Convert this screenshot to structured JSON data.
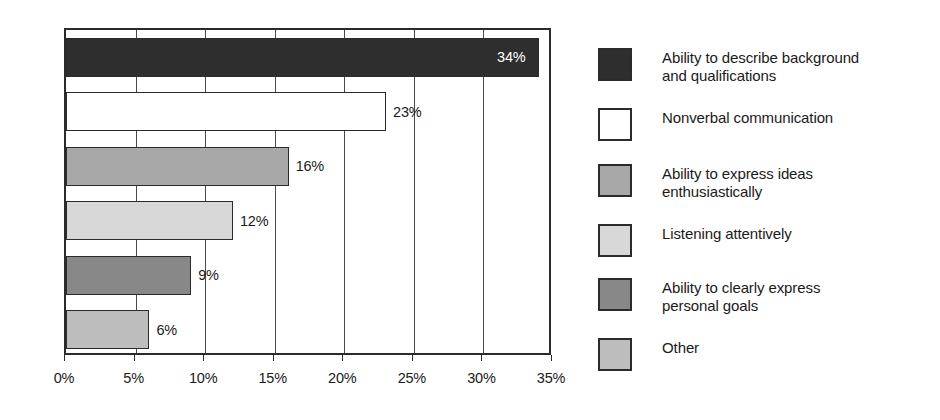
{
  "chart_data": {
    "type": "bar",
    "orientation": "horizontal",
    "title": "",
    "xlabel": "",
    "ylabel": "",
    "xlim": [
      0,
      35
    ],
    "grid": true,
    "legend_position": "right",
    "categories": [
      "Ability to describe background and qualifications",
      "Nonverbal communication",
      "Ability to express ideas enthusiastically",
      "Listening attentively",
      "Ability to clearly express personal goals",
      "Other"
    ],
    "values": [
      34,
      23,
      16,
      12,
      9,
      6
    ],
    "value_labels": [
      "34%",
      "23%",
      "16%",
      "12%",
      "9%",
      "6%"
    ],
    "label_placement": [
      "inside",
      "outside",
      "outside",
      "outside",
      "outside",
      "outside"
    ],
    "colors": [
      "#2e2e2e",
      "#ffffff",
      "#a8a8a8",
      "#d8d8d8",
      "#888888",
      "#bdbdbd"
    ],
    "xticks": [
      0,
      5,
      10,
      15,
      20,
      25,
      30,
      35
    ],
    "xtick_labels": [
      "0%",
      "5%",
      "10%",
      "15%",
      "20%",
      "25%",
      "30%",
      "35%"
    ]
  },
  "legend": {
    "items": [
      {
        "label": "Ability to describe background\nand qualifications",
        "color": "#2e2e2e"
      },
      {
        "label": "Nonverbal communication",
        "color": "#ffffff"
      },
      {
        "label": "Ability to express ideas\nenthusiastically",
        "color": "#a8a8a8"
      },
      {
        "label": "Listening attentively",
        "color": "#d8d8d8"
      },
      {
        "label": "Ability to clearly express\npersonal goals",
        "color": "#888888"
      },
      {
        "label": "Other",
        "color": "#bdbdbd"
      }
    ]
  }
}
